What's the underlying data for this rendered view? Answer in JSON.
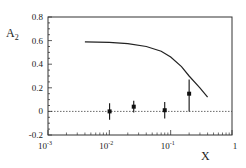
{
  "chart_data": {
    "type": "scatter",
    "title": "",
    "xlabel": "X",
    "ylabel": "A2",
    "ylabel_main": "A",
    "ylabel_sub": "2",
    "xscale": "log",
    "xlim": [
      0.001,
      1
    ],
    "ylim": [
      -0.2,
      0.8
    ],
    "grid": false,
    "legend": null,
    "x_ticks": [
      {
        "base": "10",
        "exp": "-3",
        "value": 0.001
      },
      {
        "base": "10",
        "exp": "-2",
        "value": 0.01
      },
      {
        "base": "10",
        "exp": "-1",
        "value": 0.1
      },
      {
        "base": "1",
        "exp": "",
        "value": 1
      }
    ],
    "y_ticks": [
      "-0.2",
      "0",
      "0.2",
      "0.4",
      "0.6",
      "0.8"
    ],
    "y_tick_values": [
      -0.2,
      0,
      0.2,
      0.4,
      0.6,
      0.8
    ],
    "reference_line": {
      "y": 0,
      "style": "dashed"
    },
    "series": [
      {
        "name": "data",
        "kind": "points_with_errorbars",
        "x": [
          0.0101,
          0.025,
          0.08,
          0.2
        ],
        "y": [
          0.0,
          0.04,
          0.01,
          0.15
        ],
        "err_low": [
          0.07,
          0.05,
          0.07,
          0.15
        ],
        "err_high": [
          0.07,
          0.05,
          0.07,
          0.12
        ]
      },
      {
        "name": "model curve",
        "kind": "line",
        "x": [
          0.004,
          0.01,
          0.02,
          0.04,
          0.07,
          0.1,
          0.15,
          0.2,
          0.3,
          0.4
        ],
        "y": [
          0.59,
          0.585,
          0.575,
          0.55,
          0.51,
          0.46,
          0.38,
          0.3,
          0.2,
          0.12
        ]
      }
    ]
  }
}
